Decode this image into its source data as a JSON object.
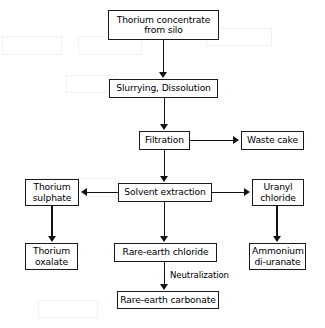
{
  "diagram": {
    "type": "process-flowchart",
    "background_color": "#ffffff",
    "line_color": "#111111",
    "box_border_color": "#1a1a1a",
    "text_color": "#000000",
    "nodes": [
      {
        "id": "thorium-concentrate",
        "label": "Thorium concentrate\nfrom silo",
        "line1": "Thorium concentrate",
        "line2": "from silo",
        "x": 108,
        "y": 10,
        "w": 111,
        "h": 30
      },
      {
        "id": "slurrying-dissolution",
        "label": "Slurrying, Dissolution",
        "line1": "Slurrying, Dissolution",
        "line2": "",
        "x": 109,
        "y": 79,
        "w": 109,
        "h": 19
      },
      {
        "id": "filtration",
        "label": "Filtration",
        "line1": "Filtration",
        "line2": "",
        "x": 139,
        "y": 131,
        "w": 51,
        "h": 19
      },
      {
        "id": "waste-cake",
        "label": "Waste cake",
        "line1": "Waste cake",
        "line2": "",
        "x": 241,
        "y": 131,
        "w": 63,
        "h": 19
      },
      {
        "id": "solvent-extraction",
        "label": "Solvent extraction",
        "line1": "Solvent extraction",
        "line2": "",
        "x": 118,
        "y": 183,
        "w": 94,
        "h": 19
      },
      {
        "id": "thorium-sulphate",
        "label": "Thorium\nsulphate",
        "line1": "Thorium",
        "line2": "sulphate",
        "x": 25,
        "y": 179,
        "w": 54,
        "h": 27
      },
      {
        "id": "uranyl-chloride",
        "label": "Uranyl\nchloride",
        "line1": "Uranyl",
        "line2": "chloride",
        "x": 252,
        "y": 179,
        "w": 52,
        "h": 27
      },
      {
        "id": "thorium-oxalate",
        "label": "Thorium\noxalate",
        "line1": "Thorium",
        "line2": "oxalate",
        "x": 25,
        "y": 243,
        "w": 53,
        "h": 27
      },
      {
        "id": "rare-earth-chloride",
        "label": "Rare-earth chloride",
        "line1": "Rare-earth chloride",
        "line2": "",
        "x": 114,
        "y": 243,
        "w": 103,
        "h": 19
      },
      {
        "id": "ammonium-di-uranate",
        "label": "Ammonium\ndi-uranate",
        "line1": "Ammonium",
        "line2": "di-uranate",
        "x": 249,
        "y": 243,
        "w": 57,
        "h": 27
      },
      {
        "id": "rare-earth-carbonate",
        "label": "Rare-earth carbonate",
        "line1": "Rare-earth carbonate",
        "line2": "",
        "x": 117,
        "y": 291,
        "w": 102,
        "h": 18
      }
    ],
    "edges": [
      {
        "id": "e1",
        "from": "thorium-concentrate",
        "to": "slurrying-dissolution",
        "direction": "down",
        "label": ""
      },
      {
        "id": "e2",
        "from": "slurrying-dissolution",
        "to": "filtration",
        "direction": "down",
        "label": ""
      },
      {
        "id": "e3",
        "from": "filtration",
        "to": "waste-cake",
        "direction": "right",
        "label": ""
      },
      {
        "id": "e4",
        "from": "filtration",
        "to": "solvent-extraction",
        "direction": "down",
        "label": ""
      },
      {
        "id": "e5",
        "from": "solvent-extraction",
        "to": "thorium-sulphate",
        "direction": "left",
        "label": ""
      },
      {
        "id": "e6",
        "from": "solvent-extraction",
        "to": "uranyl-chloride",
        "direction": "right",
        "label": ""
      },
      {
        "id": "e7",
        "from": "thorium-sulphate",
        "to": "thorium-oxalate",
        "direction": "down",
        "label": ""
      },
      {
        "id": "e8",
        "from": "solvent-extraction",
        "to": "rare-earth-chloride",
        "direction": "down",
        "label": ""
      },
      {
        "id": "e9",
        "from": "uranyl-chloride",
        "to": "ammonium-di-uranate",
        "direction": "down",
        "label": ""
      },
      {
        "id": "e10",
        "from": "rare-earth-chloride",
        "to": "rare-earth-carbonate",
        "direction": "down",
        "label": "Neutralization"
      }
    ],
    "edge_labels": [
      {
        "id": "neutralization",
        "text": "Neutralization",
        "x": 170,
        "y": 270
      }
    ]
  }
}
